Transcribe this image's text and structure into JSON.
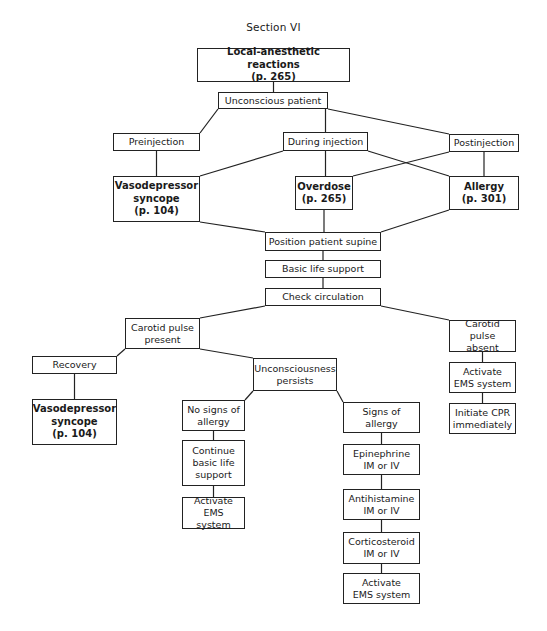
{
  "section_title": "Section VI",
  "nodes": {
    "local_anesthetic": "Local-anesthetic reactions\n(p. 265)",
    "unconscious_patient": "Unconscious patient",
    "preinjection": "Preinjection",
    "during_injection": "During injection",
    "postinjection": "Postinjection",
    "vasodepressor_top": "Vasodepressor\nsyncope\n(p. 104)",
    "overdose": "Overdose\n(p. 265)",
    "allergy": "Allergy\n(p. 301)",
    "position_supine": "Position patient supine",
    "basic_life_support": "Basic life support",
    "check_circulation": "Check circulation",
    "carotid_present": "Carotid pulse\npresent",
    "carotid_absent": "Carotid pulse\nabsent",
    "recovery": "Recovery",
    "vasodepressor_bottom": "Vasodepressor\nsyncope\n(p. 104)",
    "unconsciousness_persists": "Unconsciousness\npersists",
    "no_signs_allergy": "No signs of\nallergy",
    "signs_allergy": "Signs of\nallergy",
    "continue_bls": "Continue\nbasic life\nsupport",
    "activate_ems_left": "Activate\nEMS system",
    "epinephrine": "Epinephrine\nIM or IV",
    "antihistamine": "Antihistamine\nIM or IV",
    "corticosteroid": "Corticosteroid\nIM or IV",
    "activate_ems_allergy": "Activate\nEMS system",
    "activate_ems_absent": "Activate\nEMS system",
    "initiate_cpr": "Initiate CPR\nimmediately"
  },
  "edges": [
    [
      "local_anesthetic",
      "unconscious_patient"
    ],
    [
      "unconscious_patient",
      "preinjection"
    ],
    [
      "unconscious_patient",
      "during_injection"
    ],
    [
      "unconscious_patient",
      "postinjection"
    ],
    [
      "preinjection",
      "vasodepressor_top"
    ],
    [
      "during_injection",
      "vasodepressor_top"
    ],
    [
      "during_injection",
      "overdose"
    ],
    [
      "during_injection",
      "allergy"
    ],
    [
      "postinjection",
      "overdose"
    ],
    [
      "postinjection",
      "allergy"
    ],
    [
      "vasodepressor_top",
      "position_supine"
    ],
    [
      "overdose",
      "position_supine"
    ],
    [
      "allergy",
      "position_supine"
    ],
    [
      "position_supine",
      "basic_life_support"
    ],
    [
      "basic_life_support",
      "check_circulation"
    ],
    [
      "check_circulation",
      "carotid_present"
    ],
    [
      "check_circulation",
      "carotid_absent"
    ],
    [
      "carotid_present",
      "recovery"
    ],
    [
      "carotid_present",
      "unconsciousness_persists"
    ],
    [
      "recovery",
      "vasodepressor_bottom"
    ],
    [
      "unconsciousness_persists",
      "no_signs_allergy"
    ],
    [
      "unconsciousness_persists",
      "signs_allergy"
    ],
    [
      "no_signs_allergy",
      "continue_bls"
    ],
    [
      "continue_bls",
      "activate_ems_left"
    ],
    [
      "signs_allergy",
      "epinephrine"
    ],
    [
      "epinephrine",
      "antihistamine"
    ],
    [
      "antihistamine",
      "corticosteroid"
    ],
    [
      "corticosteroid",
      "activate_ems_allergy"
    ],
    [
      "carotid_absent",
      "activate_ems_absent"
    ],
    [
      "activate_ems_absent",
      "initiate_cpr"
    ]
  ]
}
